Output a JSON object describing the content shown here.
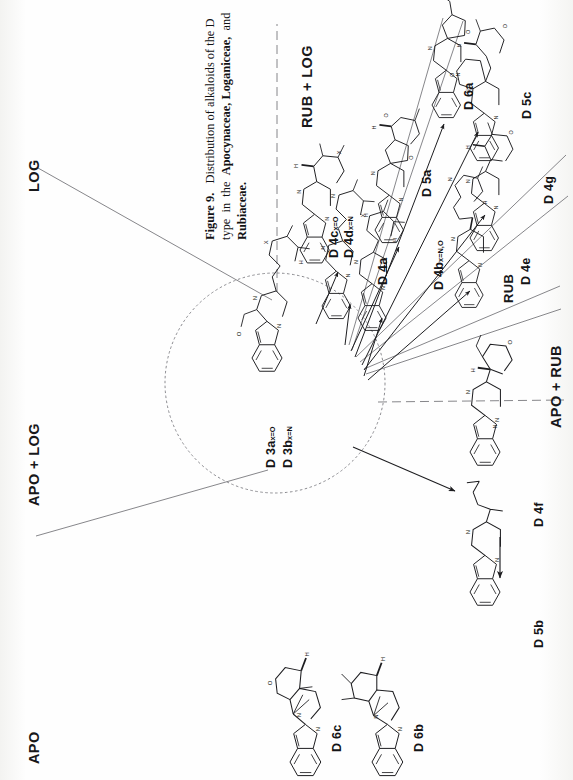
{
  "figure": {
    "id": "figure-9",
    "caption_lines": [
      "Figure 9.   Distribution of alkaloids of the D",
      "type  in  the  Apocynaceae,  Loganiceae,  and",
      "Rubiaceae."
    ],
    "caption_bold_terms": [
      "Figure 9.",
      "Apocynaceae,",
      "Loganiceae,",
      "Rubiaceae."
    ],
    "orientation": "rotated-90-ccw",
    "background_color": "#fdfdfc",
    "ink_color": "#1a1a1c",
    "rule_color": "#6b6b70"
  },
  "sectors": [
    {
      "key": "log",
      "label": "LOG"
    },
    {
      "key": "rub_log",
      "label": "RUB + LOG"
    },
    {
      "key": "apo_rub",
      "label": "APO + RUB"
    },
    {
      "key": "apo_log",
      "label": "APO + LOG"
    },
    {
      "key": "apo",
      "label": "APO"
    },
    {
      "key": "rub",
      "label": "RUB"
    }
  ],
  "center": {
    "name": "core-precursor-circle",
    "compounds": [
      {
        "label": "D 3a",
        "variant": "x=O"
      },
      {
        "label": "D 3b",
        "variant": "x=N"
      }
    ]
  },
  "compounds": [
    {
      "key": "d4c_d4d",
      "labels": [
        {
          "label": "D 4c",
          "variant": "x=O"
        },
        {
          "label": "D 4d",
          "variant": "x=N"
        }
      ]
    },
    {
      "key": "d4a",
      "labels": [
        {
          "label": "D 4a",
          "variant": ""
        }
      ]
    },
    {
      "key": "d5a",
      "labels": [
        {
          "label": "D 5a",
          "variant": ""
        }
      ]
    },
    {
      "key": "d6a",
      "labels": [
        {
          "label": "D 6a",
          "variant": ""
        }
      ]
    },
    {
      "key": "d5c",
      "labels": [
        {
          "label": "D 5c",
          "variant": ""
        }
      ]
    },
    {
      "key": "d4g",
      "labels": [
        {
          "label": "D 4g",
          "variant": ""
        }
      ]
    },
    {
      "key": "d4b",
      "labels": [
        {
          "label": "D 4b",
          "variant": "x=N,O"
        }
      ]
    },
    {
      "key": "d4e",
      "labels": [
        {
          "label": "D 4e",
          "variant": ""
        }
      ]
    },
    {
      "key": "d4f",
      "labels": [
        {
          "label": "D 4f",
          "variant": ""
        }
      ]
    },
    {
      "key": "d5b",
      "labels": [
        {
          "label": "D 5b",
          "variant": ""
        }
      ]
    },
    {
      "key": "d6c",
      "labels": [
        {
          "label": "D 6c",
          "variant": ""
        }
      ]
    },
    {
      "key": "d6b",
      "labels": [
        {
          "label": "D 6b",
          "variant": ""
        }
      ]
    }
  ],
  "atom_labels": {
    "nitrogen": "N",
    "oxygen": "O",
    "hydrogen": "H",
    "variable": "X"
  }
}
